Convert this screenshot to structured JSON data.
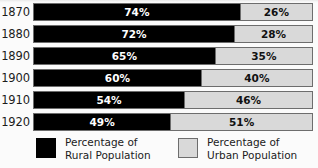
{
  "chart_data": {
    "type": "bar",
    "subtype": "stacked-horizontal-100-percent",
    "title": "",
    "xlabel": "",
    "ylabel": "",
    "xlim": [
      0,
      100
    ],
    "grid": false,
    "legend_position": "bottom",
    "categories": [
      "1870",
      "1880",
      "1890",
      "1900",
      "1910",
      "1920"
    ],
    "series": [
      {
        "name": "Percentage of Rural Population",
        "color": "#000000",
        "values": [
          74,
          72,
          65,
          60,
          54,
          49
        ],
        "labels": [
          "74%",
          "72%",
          "65%",
          "60%",
          "54%",
          "49%"
        ]
      },
      {
        "name": "Percentage of Urban Population",
        "color": "#d9d9d9",
        "values": [
          26,
          28,
          35,
          40,
          46,
          51
        ],
        "labels": [
          "26%",
          "28%",
          "35%",
          "40%",
          "46%",
          "51%"
        ]
      }
    ],
    "rows": [
      {
        "year": "1870",
        "rural": 74,
        "urban": 26,
        "rural_label": "74%",
        "urban_label": "26%"
      },
      {
        "year": "1880",
        "rural": 72,
        "urban": 28,
        "rural_label": "72%",
        "urban_label": "28%"
      },
      {
        "year": "1890",
        "rural": 65,
        "urban": 35,
        "rural_label": "65%",
        "urban_label": "35%"
      },
      {
        "year": "1900",
        "rural": 60,
        "urban": 40,
        "rural_label": "60%",
        "urban_label": "40%"
      },
      {
        "year": "1910",
        "rural": 54,
        "urban": 46,
        "rural_label": "54%",
        "urban_label": "46%"
      },
      {
        "year": "1920",
        "rural": 49,
        "urban": 51,
        "rural_label": "49%",
        "urban_label": "51%"
      }
    ]
  },
  "legend": {
    "items": [
      {
        "swatch": "black-square-swatch",
        "line1": "Percentage of",
        "line2": "Rural Population",
        "color": "#000000"
      },
      {
        "swatch": "gray-square-swatch",
        "line1": "Percentage of",
        "line2": "Urban Population",
        "color": "#d9d9d9"
      }
    ]
  },
  "colors": {
    "rural": "#000000",
    "urban": "#d9d9d9",
    "border": "#6d6d6d",
    "background": "#fbfbfb",
    "text": "#1b1b1b"
  }
}
